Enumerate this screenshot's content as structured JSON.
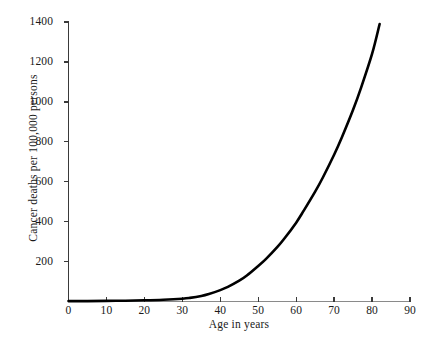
{
  "chart_data": {
    "type": "line",
    "title": "",
    "subtitle": "",
    "xlabel": "Age in years",
    "ylabel": "Cancer deaths per 100,000 persons",
    "xlim": [
      0,
      90
    ],
    "ylim": [
      0,
      1400
    ],
    "xticks": [
      0,
      10,
      20,
      30,
      40,
      50,
      60,
      70,
      80,
      90
    ],
    "xticklabels": [
      "0",
      "10",
      "20",
      "30",
      "40",
      "50",
      "60",
      "70",
      "80",
      "90"
    ],
    "yticks": [
      200,
      400,
      600,
      800,
      1000,
      1200,
      1400
    ],
    "yticklabels": [
      "200",
      "400",
      "600",
      "800",
      "1000",
      "1200",
      "1400"
    ],
    "grid": false,
    "legend": null,
    "line_color": "#000000",
    "axis_color": "#3a3a3a",
    "background_color": "#ffffff",
    "series": [
      {
        "name": "Cancer death rate",
        "x": [
          0,
          5,
          10,
          15,
          20,
          25,
          30,
          32,
          35,
          37,
          40,
          42,
          45,
          47,
          50,
          52,
          55,
          57,
          60,
          62,
          65,
          67,
          70,
          72,
          75,
          77,
          80,
          82
        ],
        "values": [
          2,
          2,
          3,
          4,
          6,
          9,
          14,
          18,
          28,
          38,
          57,
          73,
          104,
          130,
          178,
          212,
          272,
          318,
          395,
          455,
          550,
          620,
          735,
          820,
          960,
          1065,
          1240,
          1390
        ]
      }
    ]
  },
  "figure": {
    "x_axis_title": "Age in years",
    "y_axis_title": "Cancer deaths per 100,000 persons"
  }
}
